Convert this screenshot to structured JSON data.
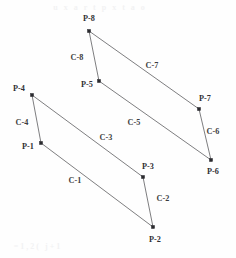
{
  "figure": {
    "width": 236,
    "height": 258,
    "background_color": "#fefefe",
    "line_color": "#6f6f72",
    "marker_color": "#2a2a2e",
    "text_color": "#3a3a3e"
  },
  "points": [
    {
      "id": "P-1",
      "label": "P-1",
      "x": 41,
      "y": 143,
      "label_x": 28,
      "label_y": 147
    },
    {
      "id": "P-2",
      "label": "P-2",
      "x": 153,
      "y": 227,
      "label_x": 155,
      "label_y": 240
    },
    {
      "id": "P-3",
      "label": "P-3",
      "x": 143,
      "y": 177,
      "label_x": 148,
      "label_y": 167
    },
    {
      "id": "P-4",
      "label": "P-4",
      "x": 32,
      "y": 95,
      "label_x": 19,
      "label_y": 89
    },
    {
      "id": "P-5",
      "label": "P-5",
      "x": 99,
      "y": 81,
      "label_x": 87,
      "label_y": 85
    },
    {
      "id": "P-6",
      "label": "P-6",
      "x": 211,
      "y": 160,
      "label_x": 213,
      "label_y": 172
    },
    {
      "id": "P-7",
      "label": "P-7",
      "x": 199,
      "y": 109,
      "label_x": 205,
      "label_y": 99
    },
    {
      "id": "P-8",
      "label": "P-8",
      "x": 89,
      "y": 31,
      "label_x": 89,
      "label_y": 19
    }
  ],
  "edges": [
    {
      "id": "C-1",
      "label": "C-1",
      "from": "P-1",
      "to": "P-2",
      "label_x": 75,
      "label_y": 181
    },
    {
      "id": "C-2",
      "label": "C-2",
      "from": "P-3",
      "to": "P-2",
      "label_x": 163,
      "label_y": 199
    },
    {
      "id": "C-3",
      "label": "C-3",
      "from": "P-4",
      "to": "P-3",
      "label_x": 106,
      "label_y": 138
    },
    {
      "id": "C-4",
      "label": "C-4",
      "from": "P-4",
      "to": "P-1",
      "label_x": 22,
      "label_y": 123
    },
    {
      "id": "C-5",
      "label": "C-5",
      "from": "P-5",
      "to": "P-6",
      "label_x": 134,
      "label_y": 123
    },
    {
      "id": "C-6",
      "label": "C-6",
      "from": "P-7",
      "to": "P-6",
      "label_x": 213,
      "label_y": 132
    },
    {
      "id": "C-7",
      "label": "C-7",
      "from": "P-8",
      "to": "P-7",
      "label_x": 152,
      "label_y": 66
    },
    {
      "id": "C-8",
      "label": "C-8",
      "from": "P-8",
      "to": "P-5",
      "label_x": 77,
      "label_y": 58
    }
  ],
  "artifacts": [
    {
      "text": "u x a r t p x t a o",
      "x": 100,
      "y": 7
    },
    {
      "text": "=1,2( j+1",
      "x": 38,
      "y": 246
    }
  ]
}
